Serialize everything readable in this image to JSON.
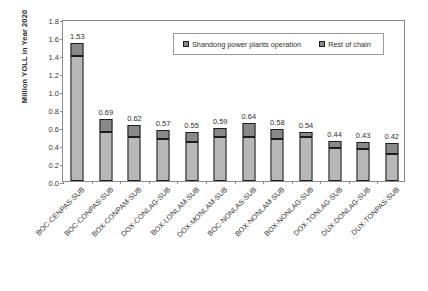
{
  "chart_data": {
    "type": "bar",
    "stacked": true,
    "title": "",
    "xlabel": "",
    "ylabel": "Million YOLL in Year 2020",
    "ylim": [
      0.0,
      1.8
    ],
    "ytick_labels": [
      "0.0",
      "0.2",
      "0.4",
      "0.6",
      "0.8",
      "1.0",
      "1.2",
      "1.4",
      "1.6",
      "1.8"
    ],
    "ytick_values": [
      0.0,
      0.2,
      0.4,
      0.6,
      0.8,
      1.0,
      1.2,
      1.4,
      1.6,
      1.8
    ],
    "grid": false,
    "legend_position": "top-center-inside",
    "categories": [
      "BOC-CENPAS-SUB",
      "BOC-CONPAS-SUB",
      "BOX-CONPAM-SUB",
      "DOX-CONLAG-SUB",
      "BOX-LONLAM-SUB",
      "DOX-MONLAM-SUB",
      "BOC-NONLAS-SUB",
      "BOX-NONLAM-SUB",
      "BOX-NONLAG-SUB",
      "DOX-TONLAG-SUB",
      "DUX-DONLAG-SUB",
      "DUX-TONPAS-SUB"
    ],
    "series": [
      {
        "name": "Rest of chain",
        "color": "#b8b8b8",
        "values": [
          1.39,
          0.54,
          0.49,
          0.465,
          0.43,
          0.485,
          0.49,
          0.47,
          0.485,
          0.37,
          0.355,
          0.3
        ]
      },
      {
        "name": "Shandong power plants operation",
        "color": "#898989",
        "values": [
          0.14,
          0.15,
          0.13,
          0.105,
          0.12,
          0.105,
          0.15,
          0.11,
          0.055,
          0.07,
          0.075,
          0.12
        ]
      }
    ],
    "totals": [
      1.53,
      0.69,
      0.62,
      0.57,
      0.55,
      0.59,
      0.64,
      0.58,
      0.54,
      0.44,
      0.43,
      0.42
    ],
    "total_labels": [
      "1.53",
      "0.69",
      "0.62",
      "0.57",
      "0.55",
      "0.59",
      "0.64",
      "0.58",
      "0.54",
      "0.44",
      "0.43",
      "0.42"
    ]
  },
  "legend": {
    "items": [
      {
        "label": "Shandong power plants operation"
      },
      {
        "label": "Rest of chain"
      }
    ]
  }
}
